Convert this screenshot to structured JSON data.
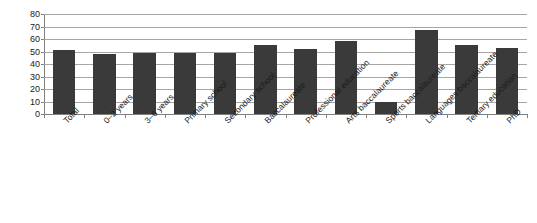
{
  "chart_data": {
    "type": "bar",
    "title": "",
    "subtitle": "",
    "xlabel": "",
    "ylabel": "",
    "ylim": [
      0,
      80
    ],
    "y_ticks": [
      0,
      10,
      20,
      30,
      40,
      50,
      60,
      70,
      80
    ],
    "grid": true,
    "legend": "none",
    "bar_color": "#3a3a3a",
    "gridline_color": "#a6a6a6",
    "axis_color": "#7f7f7f",
    "background_color": "#ffffff",
    "categories": [
      "Total",
      "0–2 years",
      "3–6 years",
      "Primary school",
      "Secondary school",
      "Baccalaureate",
      "Professional education",
      "Arts baccalaureate",
      "Sports baccalaureate",
      "Languages baccalaureate",
      "Tertiary education",
      "PhD"
    ],
    "values": [
      51,
      48,
      49,
      48.5,
      49,
      55,
      52,
      58.5,
      10,
      67.5,
      55,
      52.5
    ]
  }
}
